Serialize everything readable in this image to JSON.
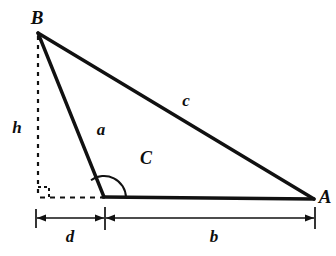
{
  "diagram": {
    "type": "geometry-triangle-diagram",
    "background_color": "#ffffff",
    "stroke_color": "#111111",
    "labels": {
      "vertex_b": "B",
      "vertex_a": "A",
      "angle_c": "C",
      "side_a": "a",
      "side_b": "b",
      "side_c": "c",
      "altitude_h": "h",
      "offset_d": "d"
    },
    "geometry": {
      "points": {
        "B": [
          38,
          33
        ],
        "C": [
          104,
          197
        ],
        "A": [
          314,
          199
        ],
        "foot_of_altitude": [
          38,
          198
        ]
      },
      "solid_segments": [
        {
          "name": "side-c-BA",
          "from": "B",
          "to": "A"
        },
        {
          "name": "side-a-BC",
          "from": "B",
          "to": "C"
        },
        {
          "name": "side-b-CA",
          "from": "C",
          "to": "A"
        }
      ],
      "dashed_segments": [
        {
          "name": "altitude-h",
          "from": [
            38,
            33
          ],
          "to": [
            38,
            198
          ]
        },
        {
          "name": "base-extension-d",
          "from": [
            38,
            198
          ],
          "to": [
            104,
            197
          ]
        }
      ],
      "right_angle_marker": {
        "at": [
          38,
          198
        ],
        "size": 11
      },
      "angle_arc": {
        "at": "C",
        "radius": 22,
        "label": "C",
        "kind": "obtuse-exterior"
      },
      "dimension_lines": [
        {
          "name": "dimension-d",
          "y": 218,
          "from_x": 36,
          "to_x": 105,
          "label": "d",
          "label_pos": [
            70,
            236
          ]
        },
        {
          "name": "dimension-b",
          "y": 218,
          "from_x": 105,
          "to_x": 315,
          "label": "b",
          "label_pos": [
            214,
            236
          ]
        }
      ]
    },
    "label_positions": {
      "B": [
        37,
        17
      ],
      "A": [
        325,
        196
      ],
      "h": [
        17,
        127
      ],
      "a": [
        101,
        129
      ],
      "c": [
        186,
        100
      ],
      "C": [
        146,
        158
      ],
      "d": [
        70,
        236
      ],
      "b": [
        214,
        236
      ]
    }
  }
}
